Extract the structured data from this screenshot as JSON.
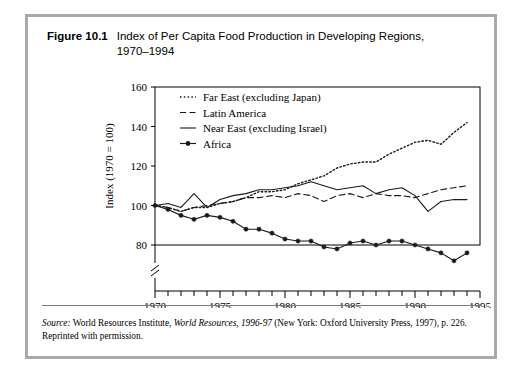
{
  "figure": {
    "number": "Figure 10.1",
    "title": "Index of Per Capita Food Production in Developing Regions, 1970–1994"
  },
  "source": {
    "label": "Source:",
    "text_1": " World Resources Institute, ",
    "italic_1": "World Resources, 1996-97",
    "text_2": " (New York: Oxford University Press, 1997), p. 226. Reprinted with permission."
  },
  "colors": {
    "frame": "#a9a9a9",
    "axis": "#000000",
    "series": "#1a1a1a",
    "background": "#ffffff"
  },
  "chart_data": {
    "type": "line",
    "title": "Index of Per Capita Food Production in Developing Regions, 1970–1994",
    "xlabel": "Year",
    "ylabel": "Index (1970 = 100)",
    "xlim": [
      1970,
      1995
    ],
    "ylim": [
      74,
      160
    ],
    "yticks": [
      80,
      100,
      120,
      140,
      160
    ],
    "xticks": [
      1970,
      1975,
      1980,
      1985,
      1990,
      1995
    ],
    "xtick_minor_step": 1,
    "grid": false,
    "axis_break": true,
    "legend_position": "top-left",
    "x": [
      1970,
      1971,
      1972,
      1973,
      1974,
      1975,
      1976,
      1977,
      1978,
      1979,
      1980,
      1981,
      1982,
      1983,
      1984,
      1985,
      1986,
      1987,
      1988,
      1989,
      1990,
      1991,
      1992,
      1993,
      1994
    ],
    "series": [
      {
        "name": "Far East (excluding Japan)",
        "style": "dotted",
        "marker": "none",
        "values": [
          100,
          99,
          97,
          99,
          99,
          101,
          102,
          104,
          107,
          107,
          108,
          111,
          113,
          115,
          119,
          121,
          122,
          122,
          126,
          129,
          132,
          133,
          131,
          137,
          142
        ]
      },
      {
        "name": "Latin America",
        "style": "dashed",
        "marker": "none",
        "values": [
          100,
          99,
          97,
          99,
          100,
          101,
          102,
          104,
          104,
          105,
          104,
          106,
          105,
          102,
          105,
          106,
          104,
          106,
          105,
          105,
          104,
          106,
          108,
          109,
          110
        ]
      },
      {
        "name": "Near East (excluding Israel)",
        "style": "solid",
        "marker": "none",
        "values": [
          100,
          101,
          99,
          106,
          99,
          103,
          105,
          106,
          108,
          108,
          109,
          110,
          112,
          110,
          108,
          109,
          110,
          106,
          108,
          109,
          105,
          97,
          102,
          103,
          103
        ]
      },
      {
        "name": "Africa",
        "style": "solid",
        "marker": "circle",
        "values": [
          100,
          98,
          95,
          93,
          95,
          94,
          92,
          88,
          88,
          86,
          83,
          82,
          82,
          79,
          78,
          81,
          82,
          80,
          82,
          82,
          80,
          78,
          76,
          72,
          76
        ]
      }
    ]
  },
  "legend": {
    "items": [
      {
        "label": "Far East (excluding Japan)",
        "style": "dotted"
      },
      {
        "label": "Latin America",
        "style": "dashed"
      },
      {
        "label": "Near East (excluding Israel)",
        "style": "solid"
      },
      {
        "label": "Africa",
        "style": "solid-marker"
      }
    ]
  }
}
